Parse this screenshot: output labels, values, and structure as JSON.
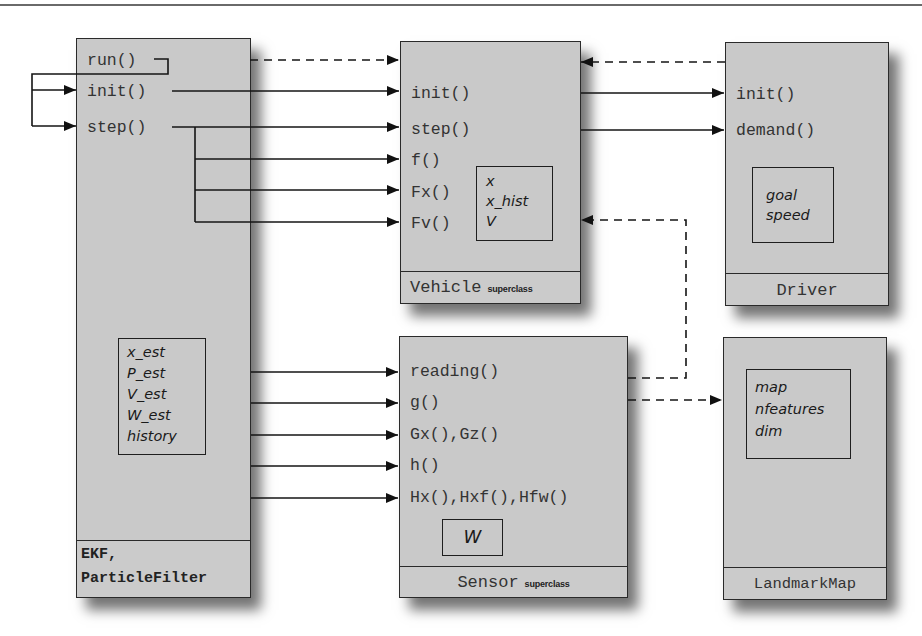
{
  "diagram": {
    "type": "class-interaction-diagram",
    "classes": {
      "filter": {
        "footer_line1": "EKF,",
        "footer_line2": "ParticleFilter",
        "methods": [
          "run()",
          "init()",
          "step()"
        ],
        "properties": [
          "x_est",
          "P_est",
          "V_est",
          "W_est",
          "history"
        ]
      },
      "vehicle": {
        "footer_name": "Vehicle",
        "footer_tag": "superclass",
        "methods": [
          "init()",
          "step()",
          "f()",
          "Fx()",
          "Fv()"
        ],
        "properties": [
          "x",
          "x_hist",
          "V"
        ]
      },
      "driver": {
        "footer_name": "Driver",
        "methods": [
          "init()",
          "demand()"
        ],
        "properties": [
          "goal",
          "speed"
        ]
      },
      "sensor": {
        "footer_name": "Sensor",
        "footer_tag": "superclass",
        "methods": [
          "reading()",
          "g()",
          "Gx(),Gz()",
          "h()",
          "Hx(),Hxf(),Hfw()"
        ],
        "properties": [
          "W"
        ]
      },
      "map": {
        "footer_name": "LandmarkMap",
        "properties": [
          "map",
          "nfeatures",
          "dim"
        ]
      }
    },
    "connections": [
      {
        "from": "filter.run()",
        "to": "filter.init()",
        "style": "solid"
      },
      {
        "from": "filter.run()",
        "to": "filter.step()",
        "style": "solid"
      },
      {
        "from": "filter.run()",
        "to": "vehicle",
        "style": "dashed"
      },
      {
        "from": "filter.init()",
        "to": "vehicle.init()",
        "style": "solid"
      },
      {
        "from": "filter.step()",
        "to": "vehicle.step()",
        "style": "solid"
      },
      {
        "from": "filter.step()",
        "to": "vehicle.f()",
        "style": "solid"
      },
      {
        "from": "filter.step()",
        "to": "vehicle.Fx()",
        "style": "solid"
      },
      {
        "from": "filter.step()",
        "to": "vehicle.Fv()",
        "style": "solid"
      },
      {
        "from": "vehicle.init()",
        "to": "driver.init()",
        "style": "solid"
      },
      {
        "from": "vehicle.step()",
        "to": "driver.demand()",
        "style": "solid"
      },
      {
        "from": "driver",
        "to": "vehicle",
        "style": "dashed"
      },
      {
        "from": "sensor.reading()",
        "to": "vehicle",
        "style": "dashed"
      },
      {
        "from": "sensor",
        "to": "map",
        "style": "dashed"
      },
      {
        "from": "filter",
        "to": "sensor.reading()",
        "style": "solid"
      },
      {
        "from": "filter",
        "to": "sensor.g()",
        "style": "solid"
      },
      {
        "from": "filter",
        "to": "sensor.Gx(),Gz()",
        "style": "solid"
      },
      {
        "from": "filter",
        "to": "sensor.h()",
        "style": "solid"
      },
      {
        "from": "filter",
        "to": "sensor.Hx(),Hxf(),Hfw()",
        "style": "solid"
      }
    ],
    "colors": {
      "box_fill": "#c9c9c9",
      "line": "#1a1a1a",
      "text": "#333333"
    }
  }
}
